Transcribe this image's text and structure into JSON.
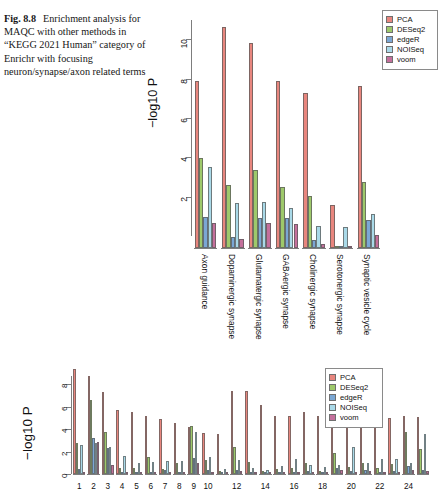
{
  "caption": {
    "label": "Fig. 8.8",
    "text": "Enrichment analysis for MAQC with other methods in “KEGG 2021 Human” category of Enrichr with focusing neuron/synapse/axon related terms"
  },
  "colors": {
    "PCA": "#e8867e",
    "DESeq2": "#9ec96b",
    "edgeR": "#7ba7d4",
    "NOISeq": "#a9d9e8",
    "voom": "#c4709c",
    "axis": "#7d7d7d",
    "text": "#111111",
    "background": "#ffffff"
  },
  "legend": {
    "entries": [
      {
        "label": "PCA",
        "color": "#e8867e"
      },
      {
        "label": "DESeq2",
        "color": "#9ec96b"
      },
      {
        "label": "edgeR",
        "color": "#7ba7d4"
      },
      {
        "label": "NOISeq",
        "color": "#a9d9e8"
      },
      {
        "label": "voom",
        "color": "#c4709c"
      }
    ]
  },
  "chart_data": [
    {
      "id": "top",
      "type": "bar",
      "title": "",
      "xlabel": "",
      "ylabel": "−log10 P",
      "ylim": [
        0,
        11.6
      ],
      "yticks": [
        2,
        4,
        6,
        8,
        10
      ],
      "ytick_labels": [
        "2",
        "4",
        "6",
        "8",
        "10"
      ],
      "grid": false,
      "legend_position": "top-right",
      "categories": [
        "Axon guidance",
        "Dopaminergic synapse",
        "Glutamatergic synapse",
        "GABAergic synapse",
        "Cholinergic synapse",
        "Serotonergic synapse",
        "Synaptic vesicle cycle"
      ],
      "series": [
        {
          "name": "PCA",
          "color": "#e8867e",
          "values": [
            8.5,
            11.25,
            10.45,
            8.5,
            7.9,
            2.2,
            8.25
          ]
        },
        {
          "name": "DESeq2",
          "color": "#9ec96b",
          "values": [
            4.6,
            3.2,
            3.95,
            3.1,
            2.65,
            0.0,
            3.35
          ]
        },
        {
          "name": "edgeR",
          "color": "#7ba7d4",
          "values": [
            1.6,
            0.55,
            1.55,
            1.55,
            0.4,
            0.0,
            1.45
          ]
        },
        {
          "name": "NOISeq",
          "color": "#a9d9e8",
          "values": [
            4.1,
            2.3,
            2.35,
            2.05,
            1.1,
            1.05,
            1.75
          ]
        },
        {
          "name": "voom",
          "color": "#c4709c",
          "values": [
            1.25,
            0.45,
            1.25,
            1.2,
            0.2,
            0.1,
            0.65
          ]
        }
      ]
    },
    {
      "id": "bottom",
      "type": "bar",
      "title": "",
      "xlabel": "",
      "ylabel": "−log10 P",
      "ylim": [
        0,
        9.6
      ],
      "yticks": [
        0,
        2,
        4,
        6,
        8
      ],
      "ytick_labels": [
        "0",
        "2",
        "4",
        "6",
        "8"
      ],
      "grid": false,
      "legend_position": "top-right",
      "categories": [
        "1",
        "2",
        "3",
        "4",
        "5",
        "6",
        "7",
        "8",
        "9",
        "10",
        "11",
        "12",
        "13",
        "14",
        "15",
        "16",
        "17",
        "18",
        "19",
        "20",
        "21",
        "22",
        "23",
        "24",
        "25"
      ],
      "xtick_labels": [
        "1",
        "2",
        "3",
        "4",
        "5",
        "6",
        "7",
        "8",
        "9",
        "10",
        "12",
        "14",
        "16",
        "18",
        "20",
        "22",
        "24"
      ],
      "xtick_positions": [
        1,
        2,
        3,
        4,
        5,
        6,
        7,
        8,
        9,
        10,
        12,
        14,
        16,
        18,
        20,
        22,
        24
      ],
      "series": [
        {
          "name": "PCA",
          "color": "#e8867e",
          "values": [
            9.35,
            8.75,
            7.25,
            5.7,
            5.55,
            5.15,
            4.9,
            4.5,
            4.2,
            3.65,
            3.6,
            7.4,
            7.4,
            6.1,
            5.2,
            5.2,
            5.5,
            5.2,
            5.2,
            5.4,
            4.95,
            5.0,
            5.0,
            5.2,
            5.05
          ]
        },
        {
          "name": "DESeq2",
          "color": "#9ec96b",
          "values": [
            2.75,
            6.6,
            3.75,
            0.55,
            0.5,
            1.5,
            0.45,
            0.95,
            4.3,
            1.25,
            0.3,
            2.4,
            1.05,
            0.25,
            0.45,
            0.5,
            0.95,
            0.3,
            1.85,
            0.6,
            1.0,
            0.55,
            0.9,
            3.7,
            2.25
          ]
        },
        {
          "name": "edgeR",
          "color": "#7ba7d4",
          "values": [
            0.45,
            3.2,
            2.35,
            0.15,
            0.1,
            0.2,
            0.4,
            0.1,
            1.4,
            0.4,
            0.15,
            0.4,
            0.2,
            0.1,
            0.15,
            0.1,
            0.3,
            0.1,
            0.55,
            0.25,
            0.35,
            0.2,
            0.3,
            0.75,
            0.4
          ]
        },
        {
          "name": "NOISeq",
          "color": "#a9d9e8",
          "values": [
            2.55,
            2.8,
            2.4,
            1.6,
            0.95,
            1.05,
            1.2,
            1.2,
            3.7,
            1.5,
            0.45,
            1.25,
            0.5,
            0.35,
            0.7,
            1.3,
            0.8,
            0.6,
            0.8,
            2.4,
            0.95,
            1.3,
            1.3,
            1.0,
            3.6
          ]
        },
        {
          "name": "voom",
          "color": "#c4709c",
          "values": [
            0.2,
            2.85,
            0.8,
            0.15,
            0.1,
            0.2,
            0.15,
            0.15,
            0.95,
            0.2,
            0.1,
            0.25,
            0.15,
            0.1,
            0.1,
            0.15,
            0.2,
            0.1,
            0.35,
            0.2,
            0.25,
            0.15,
            0.2,
            0.35,
            0.25
          ]
        }
      ]
    }
  ]
}
